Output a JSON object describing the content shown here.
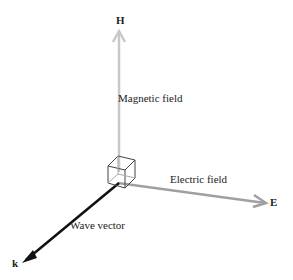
{
  "diagram": {
    "type": "electromagnetic-wave-vectors",
    "axes": {
      "magnetic": {
        "symbol": "H",
        "label": "Magnetic field",
        "color": "#c8c8c8"
      },
      "electric": {
        "symbol": "E",
        "label": "Electric field",
        "color": "#a0a0a0"
      },
      "wave": {
        "symbol": "k",
        "label": "Wave vector",
        "color": "#111111"
      }
    }
  }
}
